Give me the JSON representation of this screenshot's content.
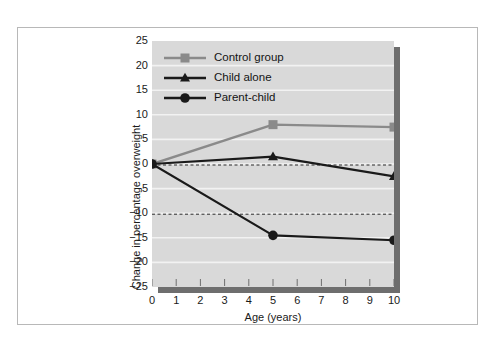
{
  "chart_data": {
    "type": "line",
    "title": "",
    "xlabel": "Age (years)",
    "ylabel": "Change in percentage overweight",
    "x": [
      0,
      5,
      10
    ],
    "xlim": [
      0,
      10
    ],
    "ylim": [
      -25,
      25
    ],
    "xticks": [
      "0",
      "1",
      "2",
      "3",
      "4",
      "5",
      "6",
      "7",
      "8",
      "9",
      "10"
    ],
    "yticks": [
      "25",
      "20",
      "15",
      "10",
      "5",
      "0",
      "-5",
      "-10",
      "-15",
      "-20",
      "-25"
    ],
    "grid": "horizontal-white-gridlines",
    "legend_position": "top-left-inside",
    "reference_lines": [
      {
        "value": 0,
        "style": "dashed"
      },
      {
        "value": -10,
        "style": "dashed"
      }
    ],
    "series": [
      {
        "name": "Control group",
        "marker": "square",
        "color": "#8a8a8a",
        "values": [
          0,
          8,
          7.5
        ]
      },
      {
        "name": "Child alone",
        "marker": "triangle",
        "color": "#1a1a1a",
        "values": [
          0,
          1.5,
          -2.5
        ]
      },
      {
        "name": "Parent-child",
        "marker": "circle",
        "color": "#1a1a1a",
        "values": [
          0,
          -14.5,
          -15.5
        ]
      }
    ]
  },
  "axes": {
    "xlabel": "Age (years)",
    "ylabel": "Change in percentage overweight",
    "xticks": [
      "0",
      "1",
      "2",
      "3",
      "4",
      "5",
      "6",
      "7",
      "8",
      "9",
      "10"
    ],
    "yticks": [
      "25",
      "20",
      "15",
      "10",
      "5",
      "0",
      "-5",
      "-10",
      "-15",
      "-20",
      "-25"
    ]
  },
  "legend": {
    "items": [
      {
        "label": "Control group",
        "marker": "square-marker-icon"
      },
      {
        "label": "Child alone",
        "marker": "triangle-marker-icon"
      },
      {
        "label": "Parent-child",
        "marker": "circle-marker-icon"
      }
    ]
  },
  "colors": {
    "plot_background": "#d9d9d9",
    "gridline": "#f2f2f2",
    "control_group": "#8a8a8a",
    "dark_series": "#1a1a1a",
    "frame": "#b8b8b8",
    "shadow": "#6e6e6e"
  }
}
